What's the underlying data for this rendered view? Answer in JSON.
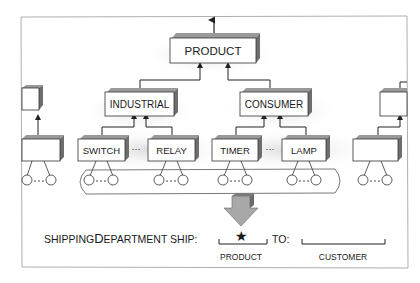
{
  "diagram": {
    "root": {
      "label": "PRODUCT"
    },
    "categories": [
      {
        "label": "INDUSTRIAL",
        "children": [
          "SWITCH",
          "RELAY"
        ]
      },
      {
        "label": "CONSUMER",
        "children": [
          "TIMER",
          "LAMP"
        ]
      }
    ],
    "ellipsis": "···",
    "caption": {
      "prefix_small": "SHIPPING",
      "prefix_large": "D",
      "prefix_rest": "EPARTMENT SHIP:",
      "slot_marker": "★",
      "to_label": "TO:",
      "product_label": "PRODUCT",
      "customer_label": "CUSTOMER"
    }
  },
  "colors": {
    "box_fill": "#ffffff",
    "box_top": "#9a9a9a",
    "box_side": "#6e6e6e",
    "line": "#333333",
    "arrow_fill": "#a8a8a8",
    "frame": "#9a9a9a"
  }
}
